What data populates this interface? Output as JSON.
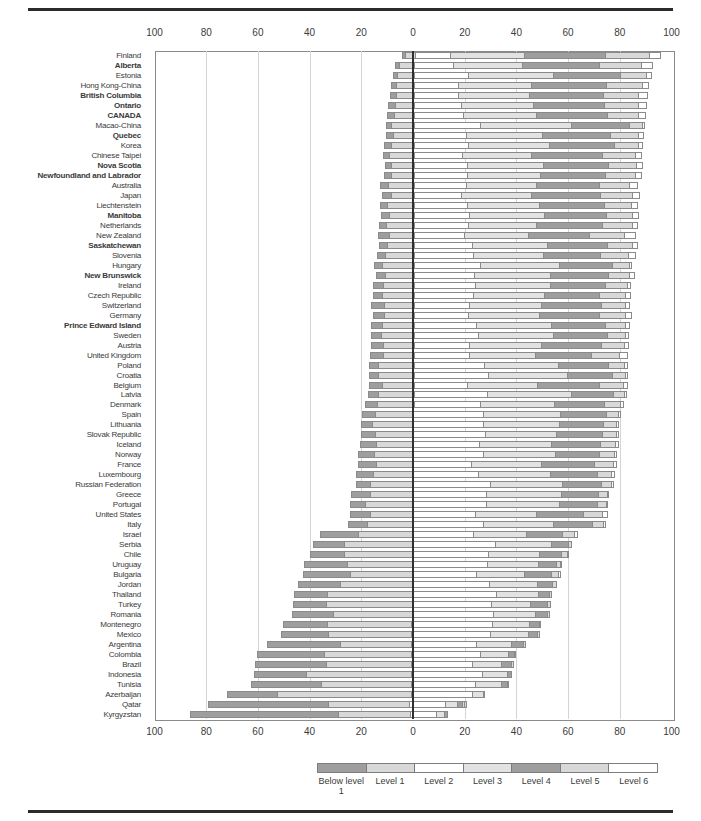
{
  "chart_data": {
    "type": "bar",
    "subtype": "horizontal-diverging-stacked",
    "title": "",
    "xlabel": "",
    "ylabel": "",
    "unit": "%",
    "axis_ticks": [
      "100",
      "80",
      "60",
      "40",
      "20",
      "0",
      "20",
      "40",
      "60",
      "80",
      "100"
    ],
    "axis_range": [
      -100,
      100
    ],
    "grid": "vertical-every-20",
    "legend_position": "bottom",
    "levels": [
      {
        "name": "Below level 1",
        "color": "#9e9e9e",
        "side": "left"
      },
      {
        "name": "Level 1",
        "color": "#d8d8d8",
        "side": "left"
      },
      {
        "name": "Level 2",
        "color": "#ffffff",
        "side": "right"
      },
      {
        "name": "Level 3",
        "color": "#e2e2e2",
        "side": "right"
      },
      {
        "name": "Level 4",
        "color": "#9e9e9e",
        "side": "right"
      },
      {
        "name": "Level 5",
        "color": "#d8d8d8",
        "side": "right"
      },
      {
        "name": "Level 6",
        "color": "#ffffff",
        "side": "right"
      }
    ],
    "categories": [
      "Finland",
      "Alberta",
      "Estonia",
      "Hong Kong-China",
      "British Columbia",
      "Ontario",
      "CANADA",
      "Macao-China",
      "Quebec",
      "Korea",
      "Chinese Taipei",
      "Nova Scotia",
      "Newfoundland and Labrador",
      "Australia",
      "Japan",
      "Liechtenstein",
      "Manitoba",
      "Netherlands",
      "New Zealand",
      "Saskatchewan",
      "Slovenia",
      "Hungary",
      "New Brunswick",
      "Ireland",
      "Czech Republic",
      "Switzerland",
      "Germany",
      "Prince Edward Island",
      "Sweden",
      "Austria",
      "United Kingdom",
      "Poland",
      "Croatia",
      "Belgium",
      "Latvia",
      "Denmark",
      "Spain",
      "Lithuania",
      "Slovak Republic",
      "Iceland",
      "Norway",
      "France",
      "Luxembourg",
      "Russian Federation",
      "Greece",
      "Portugal",
      "United States",
      "Italy",
      "Israel",
      "Serbia",
      "Chile",
      "Uruguay",
      "Bulgaria",
      "Jordan",
      "Thailand",
      "Turkey",
      "Romania",
      "Montenegro",
      "Mexico",
      "Argentina",
      "Colombia",
      "Brazil",
      "Indonesia",
      "Tunisia",
      "Azerbaijan",
      "Qatar",
      "Kyrgyzstan"
    ],
    "bold_categories": [
      "Alberta",
      "British Columbia",
      "Ontario",
      "CANADA",
      "Quebec",
      "Nova Scotia",
      "Newfoundland and Labrador",
      "Manitoba",
      "Saskatchewan",
      "New Brunswick",
      "Prince Edward Island"
    ],
    "series": [
      {
        "name": "Below level 1",
        "values": [
          0.5,
          1.4,
          1.0,
          1.7,
          1.8,
          2.1,
          2.2,
          1.4,
          2.6,
          2.5,
          1.9,
          2.3,
          2.4,
          3.0,
          3.2,
          2.6,
          2.9,
          2.3,
          4.0,
          2.7,
          2.8,
          2.7,
          3.2,
          3.5,
          3.5,
          4.5,
          4.1,
          3.8,
          3.8,
          4.3,
          4.8,
          3.2,
          3.0,
          4.8,
          3.6,
          4.3,
          4.7,
          4.3,
          5.2,
          5.8,
          5.9,
          6.6,
          6.5,
          5.2,
          7.2,
          5.8,
          7.6,
          7.3,
          14.9,
          11.9,
          13.1,
          16.7,
          18.3,
          16.2,
          12.6,
          12.9,
          16.0,
          17.3,
          18.2,
          28.3,
          26.2,
          27.9,
          20.3,
          27.7,
          19.6,
          47.6,
          58.2
        ]
      },
      {
        "name": "Level 1",
        "values": [
          3.6,
          5.7,
          6.7,
          7.0,
          7.1,
          7.4,
          7.8,
          8.9,
          7.9,
          8.7,
          9.7,
          8.7,
          9.0,
          9.8,
          8.9,
          10.2,
          9.6,
          10.7,
          9.7,
          10.3,
          11.1,
          12.3,
          11.1,
          12.0,
          12.1,
          11.6,
          11.3,
          12.4,
          12.6,
          12.0,
          11.9,
          13.8,
          14.0,
          12.2,
          13.8,
          14.1,
          14.9,
          16.0,
          15.0,
          14.7,
          15.2,
          14.5,
          15.6,
          17.0,
          16.9,
          18.7,
          16.8,
          18.0,
          21.2,
          26.6,
          26.7,
          25.4,
          24.3,
          28.2,
          33.5,
          33.7,
          30.9,
          33.0,
          32.8,
          28.0,
          34.0,
          33.1,
          41.3,
          35.1,
          52.4,
          31.7,
          28.2
        ]
      },
      {
        "name": "Level 2",
        "values": [
          13.6,
          15.0,
          21.0,
          16.9,
          17.0,
          18.3,
          19.1,
          26.0,
          20.2,
          21.2,
          18.6,
          20.8,
          20.8,
          20.2,
          18.5,
          20.9,
          21.4,
          21.1,
          19.7,
          22.8,
          23.1,
          26.0,
          23.6,
          24.0,
          23.4,
          21.8,
          21.4,
          24.6,
          25.2,
          21.8,
          21.8,
          27.5,
          29.3,
          20.8,
          29.0,
          26.0,
          27.4,
          27.4,
          28.0,
          25.9,
          27.3,
          22.8,
          25.4,
          30.2,
          28.9,
          28.8,
          24.2,
          27.6,
          24.0,
          32.3,
          29.9,
          29.8,
          25.2,
          30.3,
          33.2,
          31.3,
          31.8,
          31.5,
          30.8,
          25.6,
          27.2,
          23.8,
          27.5,
          25.1,
          23.7,
          14.0,
          10.0
        ]
      },
      {
        "name": "Level 3",
        "values": [
          29.1,
          27.0,
          33.7,
          28.7,
          28.0,
          28.5,
          28.8,
          35.7,
          30.0,
          31.8,
          27.3,
          29.7,
          28.8,
          27.7,
          27.5,
          28.3,
          29.5,
          26.9,
          25.1,
          29.7,
          27.6,
          31.1,
          29.8,
          29.7,
          27.8,
          28.2,
          27.9,
          29.3,
          29.5,
          28.3,
          25.9,
          29.4,
          31.0,
          27.6,
          32.9,
          29.3,
          30.2,
          29.8,
          28.1,
          28.3,
          28.5,
          27.2,
          28.6,
          28.3,
          29.4,
          28.8,
          24.0,
          27.4,
          20.8,
          22.1,
          20.1,
          19.8,
          18.8,
          18.6,
          16.3,
          15.1,
          16.6,
          14.5,
          14.8,
          13.5,
          10.6,
          11.3,
          9.5,
          10.0,
          4.0,
          4.6,
          2.9
        ]
      },
      {
        "name": "Level 4",
        "values": [
          32.2,
          30.3,
          26.2,
          29.7,
          29.0,
          27.8,
          27.7,
          22.8,
          26.6,
          25.5,
          27.9,
          25.6,
          25.5,
          24.6,
          27.0,
          25.4,
          24.5,
          25.8,
          23.9,
          23.5,
          22.5,
          21.0,
          22.7,
          21.4,
          21.7,
          23.5,
          23.6,
          21.1,
          21.1,
          23.6,
          21.8,
          19.3,
          17.7,
          24.5,
          16.6,
          19.5,
          17.9,
          17.5,
          17.9,
          19.0,
          17.1,
          20.9,
          18.1,
          15.1,
          14.2,
          14.7,
          18.3,
          15.1,
          13.8,
          6.4,
          8.4,
          6.7,
          10.3,
          5.8,
          4.0,
          6.2,
          4.2,
          3.4,
          3.2,
          4.1,
          1.9,
          3.4,
          1.4,
          1.9,
          0.3,
          1.6,
          0.6
        ]
      },
      {
        "name": "Level 5",
        "values": [
          17.0,
          16.6,
          10.1,
          13.9,
          13.9,
          13.2,
          12.0,
          5.0,
          11.0,
          9.2,
          12.9,
          10.9,
          11.3,
          11.8,
          12.4,
          10.3,
          10.2,
          11.5,
          13.6,
          9.3,
          10.7,
          6.2,
          8.2,
          8.3,
          9.8,
          9.1,
          10.0,
          7.7,
          6.8,
          8.8,
          10.9,
          6.1,
          4.6,
          9.1,
          3.8,
          6.1,
          4.5,
          4.5,
          5.2,
          5.6,
          5.5,
          7.2,
          5.4,
          3.7,
          3.2,
          3.0,
          7.5,
          4.2,
          4.4,
          0.7,
          1.8,
          1.4,
          2.6,
          0.9,
          0.4,
          0.9,
          0.5,
          0.3,
          0.3,
          0.4,
          0.2,
          0.5,
          0.0,
          0.1,
          0.0,
          0.4,
          0.0
        ]
      },
      {
        "name": "Level 6",
        "values": [
          3.9,
          4.0,
          1.4,
          2.1,
          3.2,
          2.7,
          2.4,
          0.3,
          1.7,
          1.1,
          1.7,
          2.0,
          2.2,
          2.8,
          2.6,
          2.2,
          1.9,
          1.7,
          4.0,
          1.7,
          2.2,
          0.6,
          1.4,
          1.1,
          1.8,
          1.4,
          1.8,
          1.1,
          1.1,
          1.2,
          2.9,
          0.7,
          0.5,
          1.0,
          0.3,
          0.7,
          0.3,
          0.4,
          0.6,
          0.7,
          0.6,
          0.8,
          0.5,
          0.5,
          0.2,
          0.1,
          1.5,
          0.4,
          0.8,
          0.0,
          0.1,
          0.1,
          0.4,
          0.0,
          0.0,
          0.0,
          0.0,
          0.0,
          0.0,
          0.0,
          0.0,
          0.0,
          0.0,
          0.0,
          0.0,
          0.1,
          0.0
        ]
      }
    ]
  },
  "legend": {
    "items": [
      {
        "label": "Below level 1"
      },
      {
        "label": "Level 1"
      },
      {
        "label": "Level 2"
      },
      {
        "label": "Level 3"
      },
      {
        "label": "Level 4"
      },
      {
        "label": "Level 5"
      },
      {
        "label": "Level 6"
      }
    ]
  }
}
